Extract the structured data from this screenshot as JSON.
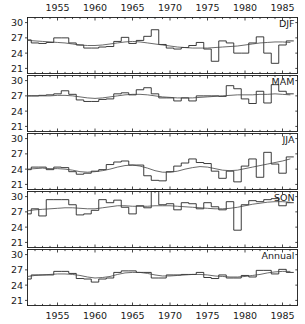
{
  "chart_data": {
    "type": "line",
    "title": "",
    "xlabel": "",
    "ylabel": "",
    "xlim": [
      1951,
      1987
    ],
    "ylim": [
      20,
      31
    ],
    "grid": false,
    "legend": null,
    "axis": {
      "x_ticks": [
        1955,
        1960,
        1965,
        1970,
        1975,
        1980,
        1985
      ],
      "x_tick_labels": [
        "1955",
        "1960",
        "1965",
        "1970",
        "1975",
        "1980",
        "1985"
      ],
      "x_minor_step": 1,
      "y_ticks": [
        21,
        24,
        27,
        30
      ],
      "y_tick_labels": [
        "21",
        "24",
        "27",
        "30"
      ],
      "x_axis_top": true,
      "x_axis_bottom": true
    },
    "panels": [
      {
        "label": "DJF",
        "x": [
          1951,
          1952,
          1953,
          1954,
          1955,
          1956,
          1957,
          1958,
          1959,
          1960,
          1961,
          1962,
          1963,
          1964,
          1965,
          1966,
          1967,
          1968,
          1969,
          1970,
          1971,
          1972,
          1973,
          1974,
          1975,
          1976,
          1977,
          1978,
          1979,
          1980,
          1981,
          1982,
          1983,
          1984,
          1985,
          1986
        ],
        "values": [
          26.6,
          26.0,
          25.9,
          26.1,
          27.0,
          27.0,
          26.0,
          25.6,
          25.0,
          25.0,
          25.2,
          25.3,
          26.3,
          27.1,
          25.9,
          26.5,
          27.3,
          28.6,
          25.7,
          25.0,
          24.8,
          25.1,
          25.5,
          26.1,
          24.8,
          22.4,
          26.4,
          26.0,
          24.0,
          24.0,
          26.0,
          27.2,
          24.0,
          22.0,
          25.6,
          26.4
        ],
        "series2_values": [
          26.5,
          26.4,
          26.3,
          26.2,
          26.1,
          26.0,
          25.8,
          25.6,
          25.5,
          25.5,
          25.6,
          25.8,
          26.0,
          26.2,
          26.3,
          26.2,
          26.0,
          25.8,
          25.6,
          25.4,
          25.2,
          25.1,
          25.0,
          25.0,
          25.0,
          25.1,
          25.2,
          25.3,
          25.4,
          25.6,
          25.8,
          26.0,
          26.1,
          26.2,
          26.2,
          26.1
        ],
        "series_names": [
          "seasonal-anomaly-step",
          "smoothed-trend"
        ]
      },
      {
        "label": "MAM",
        "x": [
          1951,
          1952,
          1953,
          1954,
          1955,
          1956,
          1957,
          1958,
          1959,
          1960,
          1961,
          1962,
          1963,
          1964,
          1965,
          1966,
          1967,
          1968,
          1969,
          1970,
          1971,
          1972,
          1973,
          1974,
          1975,
          1976,
          1977,
          1978,
          1979,
          1980,
          1981,
          1982,
          1983,
          1984,
          1985,
          1986
        ],
        "values": [
          27.0,
          27.0,
          27.1,
          27.2,
          27.4,
          28.0,
          27.3,
          26.2,
          25.9,
          25.9,
          26.3,
          26.4,
          27.4,
          27.6,
          27.2,
          28.2,
          28.6,
          27.4,
          26.6,
          26.6,
          26.0,
          26.6,
          26.0,
          27.0,
          27.0,
          27.0,
          26.9,
          29.0,
          28.4,
          26.4,
          25.5,
          27.9,
          25.6,
          29.2,
          27.9,
          27.4
        ],
        "series2_values": [
          27.0,
          27.0,
          27.0,
          27.0,
          27.1,
          27.1,
          27.0,
          26.8,
          26.6,
          26.5,
          26.6,
          26.8,
          27.0,
          27.2,
          27.3,
          27.3,
          27.2,
          27.0,
          26.8,
          26.7,
          26.6,
          26.6,
          26.6,
          26.7,
          26.8,
          26.9,
          27.0,
          27.1,
          27.2,
          27.2,
          27.2,
          27.3,
          27.3,
          27.4,
          27.3,
          27.2
        ],
        "series_names": [
          "seasonal-anomaly-step",
          "smoothed-trend"
        ]
      },
      {
        "label": "JJA",
        "x": [
          1951,
          1952,
          1953,
          1954,
          1955,
          1956,
          1957,
          1958,
          1959,
          1960,
          1961,
          1962,
          1963,
          1964,
          1965,
          1966,
          1967,
          1968,
          1969,
          1970,
          1971,
          1972,
          1973,
          1974,
          1975,
          1976,
          1977,
          1978,
          1979,
          1980,
          1981,
          1982,
          1983,
          1984,
          1985,
          1986
        ],
        "values": [
          23.9,
          24.4,
          24.4,
          23.9,
          24.4,
          24.3,
          23.5,
          23.0,
          23.2,
          23.6,
          23.9,
          24.9,
          25.4,
          25.6,
          24.8,
          24.8,
          22.7,
          21.8,
          21.7,
          23.5,
          24.6,
          25.2,
          26.0,
          25.3,
          25.1,
          23.6,
          22.2,
          23.6,
          21.5,
          24.6,
          26.0,
          22.4,
          27.3,
          25.0,
          23.2,
          26.4
        ],
        "series2_values": [
          24.0,
          24.1,
          24.2,
          24.1,
          24.1,
          24.0,
          23.8,
          23.5,
          23.4,
          23.5,
          23.7,
          24.0,
          24.4,
          24.7,
          24.8,
          24.6,
          24.2,
          23.7,
          23.4,
          23.4,
          23.6,
          24.0,
          24.3,
          24.5,
          24.4,
          24.1,
          23.8,
          23.7,
          23.8,
          24.1,
          24.4,
          24.7,
          25.0,
          25.3,
          25.6,
          26.0
        ],
        "series_names": [
          "seasonal-anomaly-step",
          "smoothed-trend"
        ]
      },
      {
        "label": "SON",
        "x": [
          1951,
          1952,
          1953,
          1954,
          1955,
          1956,
          1957,
          1958,
          1959,
          1960,
          1961,
          1962,
          1963,
          1964,
          1965,
          1966,
          1967,
          1968,
          1969,
          1970,
          1971,
          1972,
          1973,
          1974,
          1975,
          1976,
          1977,
          1978,
          1979,
          1980,
          1981,
          1982,
          1983,
          1984,
          1985,
          1986
        ],
        "values": [
          26.6,
          27.6,
          26.2,
          29.4,
          29.4,
          29.4,
          28.4,
          26.4,
          26.6,
          27.3,
          29.4,
          28.8,
          29.3,
          27.9,
          26.6,
          28.2,
          27.8,
          31.0,
          28.4,
          28.6,
          27.4,
          28.8,
          28.6,
          27.6,
          28.8,
          28.0,
          27.4,
          29.0,
          23.4,
          28.4,
          29.2,
          29.0,
          29.4,
          29.6,
          28.2,
          28.8
        ],
        "series2_values": [
          27.2,
          27.4,
          27.5,
          27.6,
          27.7,
          27.8,
          27.8,
          27.7,
          27.6,
          27.6,
          27.8,
          28.0,
          28.2,
          28.2,
          28.1,
          28.1,
          28.1,
          28.2,
          28.2,
          28.2,
          28.1,
          28.0,
          27.9,
          27.8,
          27.7,
          27.6,
          27.6,
          27.7,
          27.9,
          28.2,
          28.5,
          28.7,
          28.9,
          29.0,
          29.0,
          28.9
        ],
        "series_names": [
          "seasonal-anomaly-step",
          "smoothed-trend"
        ]
      },
      {
        "label": "Annual",
        "x": [
          1951,
          1952,
          1953,
          1954,
          1955,
          1956,
          1957,
          1958,
          1959,
          1960,
          1961,
          1962,
          1963,
          1964,
          1965,
          1966,
          1967,
          1968,
          1969,
          1970,
          1971,
          1972,
          1973,
          1974,
          1975,
          1976,
          1977,
          1978,
          1979,
          1980,
          1981,
          1982,
          1983,
          1984,
          1985,
          1986
        ],
        "values": [
          25.2,
          26.0,
          26.0,
          26.0,
          26.7,
          26.7,
          26.3,
          25.3,
          25.2,
          24.6,
          25.2,
          25.4,
          26.5,
          26.8,
          26.8,
          26.5,
          26.5,
          25.4,
          25.4,
          26.0,
          26.0,
          26.1,
          26.1,
          26.5,
          25.5,
          25.3,
          26.0,
          25.4,
          25.4,
          25.9,
          25.6,
          26.9,
          26.9,
          26.2,
          27.1,
          26.5
        ],
        "series2_values": [
          25.7,
          25.9,
          26.0,
          26.1,
          26.2,
          26.2,
          26.1,
          25.9,
          25.6,
          25.4,
          25.5,
          25.7,
          26.1,
          26.4,
          26.5,
          26.5,
          26.3,
          26.0,
          25.8,
          25.8,
          25.9,
          26.0,
          26.1,
          26.1,
          26.0,
          25.8,
          25.7,
          25.6,
          25.6,
          25.7,
          25.9,
          26.1,
          26.4,
          26.6,
          26.7,
          26.7
        ],
        "series_names": [
          "annual-anomaly-step",
          "smoothed-trend"
        ]
      }
    ]
  }
}
